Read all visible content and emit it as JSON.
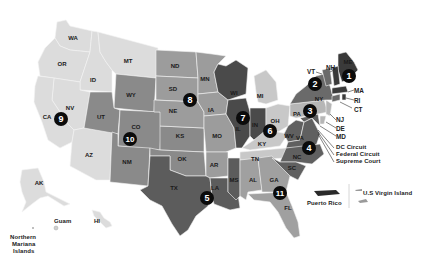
{
  "map": {
    "subject": "U.S. Federal Judicial Circuits",
    "colors": {
      "background": "#ffffff",
      "lightest": "#dcdcdc",
      "light": "#c4c4c4",
      "medium_light": "#a8a8a8",
      "medium": "#8e8e8e",
      "dark": "#747474",
      "darker": "#5e5e5e",
      "darkest": "#3e3e3e",
      "badge": "#0b0b0b",
      "badge_text": "#ffffff"
    },
    "circuits": [
      {
        "number": "1",
        "states": [
          "ME",
          "NH",
          "MA",
          "RI"
        ]
      },
      {
        "number": "2",
        "states": [
          "NY",
          "VT",
          "CT"
        ]
      },
      {
        "number": "3",
        "states": [
          "PA",
          "NJ",
          "DE"
        ]
      },
      {
        "number": "4",
        "states": [
          "MD",
          "VA",
          "WV",
          "NC",
          "SC"
        ]
      },
      {
        "number": "5",
        "states": [
          "TX",
          "LA",
          "MS"
        ]
      },
      {
        "number": "6",
        "states": [
          "OH",
          "MI",
          "KY",
          "TN"
        ]
      },
      {
        "number": "7",
        "states": [
          "IL",
          "IN",
          "WI"
        ]
      },
      {
        "number": "8",
        "states": [
          "ND",
          "SD",
          "NE",
          "MN",
          "IA",
          "MO",
          "AR"
        ]
      },
      {
        "number": "9",
        "states": [
          "WA",
          "OR",
          "CA",
          "NV",
          "ID",
          "MT",
          "AZ",
          "AK",
          "HI"
        ]
      },
      {
        "number": "10",
        "states": [
          "WY",
          "UT",
          "CO",
          "KS",
          "OK",
          "NM"
        ]
      },
      {
        "number": "11",
        "states": [
          "AL",
          "GA",
          "FL"
        ]
      }
    ],
    "state_labels": {
      "WA": "WA",
      "OR": "OR",
      "CA": "CA",
      "NV": "NV",
      "ID": "ID",
      "MT": "MT",
      "AZ": "AZ",
      "WY": "WY",
      "UT": "UT",
      "CO": "CO",
      "NM": "NM",
      "KS": "KS",
      "OK": "OK",
      "ND": "ND",
      "SD": "SD",
      "NE": "NE",
      "MN": "MN",
      "IA": "IA",
      "MO": "MO",
      "AR": "AR",
      "TX": "TX",
      "LA": "LA",
      "MS": "MS",
      "WI": "WI",
      "IL": "IL",
      "IN": "IN",
      "MI": "MI",
      "OH": "OH",
      "KY": "KY",
      "TN": "TN",
      "AL": "AL",
      "GA": "GA",
      "FL": "FL",
      "PA": "PA",
      "WV": "WV",
      "VA": "VA",
      "NC": "NC",
      "SC": "SC",
      "NY": "NY",
      "ME": "ME",
      "AK": "AK",
      "HI": "HI"
    },
    "callouts": {
      "VT": "VT",
      "NH": "NH",
      "MA": "MA",
      "RI": "RI",
      "CT": "CT",
      "NJ": "NJ",
      "DE": "DE",
      "MD": "MD",
      "dc_circuit": "DC Circuit",
      "federal_circuit": "Federal Circuit",
      "supreme_court": "Supreme Court"
    },
    "territories": {
      "guam": "Guam",
      "northern_mariana_1": "Northern",
      "northern_mariana_2": "Mariana",
      "northern_mariana_3": "Islands",
      "puerto_rico": "Puerto Rico",
      "us_virgin_island": "U.S Virgin Island"
    },
    "badges": [
      "1",
      "2",
      "3",
      "4",
      "5",
      "6",
      "7",
      "8",
      "9",
      "10",
      "11"
    ]
  }
}
